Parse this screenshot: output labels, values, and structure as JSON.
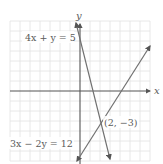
{
  "diagram": {
    "type": "coordinate-plane",
    "axes": {
      "x_label": "x",
      "y_label": "y"
    },
    "grid": {
      "x_min": -7,
      "x_max": 7,
      "y_min": -7,
      "y_max": 7,
      "step": 1
    },
    "lines": [
      {
        "equation": "4x + y = 5",
        "label": "4x + y = 5",
        "color": "#6a6a6a"
      },
      {
        "equation": "3x − 2y = 12",
        "label": "3x − 2y = 12",
        "color": "#6a6a6a"
      }
    ],
    "intersection": {
      "x": 2,
      "y": -3,
      "label": "(2, −3)"
    },
    "colors": {
      "grid": "#e2e2e2",
      "axis": "#555555",
      "line": "#707070",
      "text": "#5a5a5a"
    }
  }
}
